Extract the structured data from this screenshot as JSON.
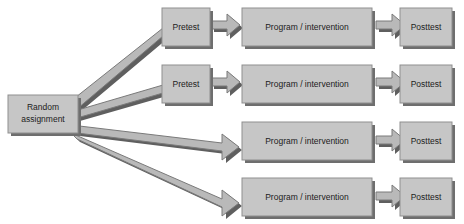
{
  "diagram": {
    "colors": {
      "box_fill": "#c6c6c6",
      "box_border": "#8f8f8f",
      "box_shadow": "#6e6e6e",
      "arrow_fill": "#b9b9b9",
      "arrow_border": "#7a7a7a",
      "text": "#1c1c1c",
      "background": "#ffffff"
    },
    "start": {
      "label_line1": "Random",
      "label_line2": "assignment"
    },
    "groups": [
      {
        "id": "group-1",
        "pretest": "Pretest",
        "program": "Program / intervention",
        "posttest": "Posttest"
      },
      {
        "id": "group-2",
        "pretest": "Pretest",
        "program": "Program / intervention",
        "posttest": "Posttest"
      },
      {
        "id": "group-3",
        "pretest": null,
        "program": "Program / intervention",
        "posttest": "Posttest"
      },
      {
        "id": "group-4",
        "pretest": null,
        "program": "Program / intervention",
        "posttest": "Posttest"
      }
    ]
  }
}
